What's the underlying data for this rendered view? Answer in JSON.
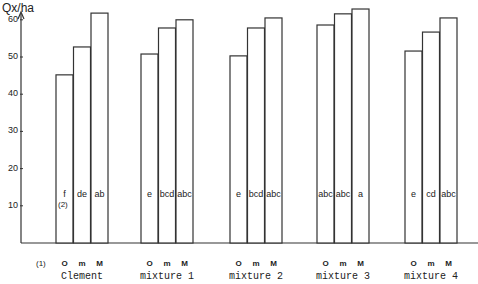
{
  "chart_data": {
    "type": "bar",
    "title": "",
    "ylabel": "Qx/ha",
    "xlabel": "",
    "ylim": [
      0,
      65
    ],
    "yticks": [
      10,
      20,
      30,
      40,
      50,
      60
    ],
    "grid": false,
    "legend": null,
    "categories": [
      "Clement",
      "mixture 1",
      "mixture 2",
      "mixture 3",
      "mixture 4"
    ],
    "sub_categories": [
      "O",
      "m",
      "M"
    ],
    "series": [
      {
        "name": "O",
        "values": [
          45.2,
          50.8,
          50.3,
          58.6,
          51.6
        ],
        "letters": [
          "f",
          "e",
          "e",
          "abc",
          "e"
        ]
      },
      {
        "name": "m",
        "values": [
          52.7,
          57.8,
          57.8,
          61.6,
          56.7
        ],
        "letters": [
          "de",
          "bcd",
          "bcd",
          "abc",
          "cd"
        ]
      },
      {
        "name": "M",
        "values": [
          61.8,
          60.0,
          60.5,
          62.9,
          60.5
        ],
        "letters": [
          "ab",
          "abc",
          "abc",
          "a",
          "abc"
        ]
      }
    ],
    "annotations": [
      "(1)",
      "(2)"
    ]
  },
  "labels": {
    "y_axis_title": "Qx/ha",
    "footnote_1": "(1)",
    "footnote_2": "(2)"
  }
}
